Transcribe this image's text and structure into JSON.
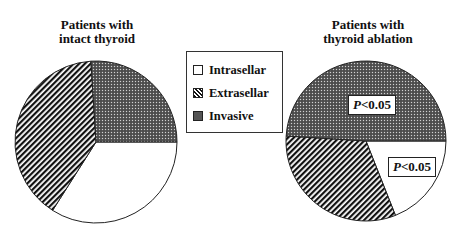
{
  "chart_data": [
    {
      "type": "pie",
      "title": "Patients with intact thyroid",
      "title_lines": [
        "Patients with",
        "intact thyroid"
      ],
      "categories": [
        "Intrasellar",
        "Extrasellar",
        "Invasive"
      ],
      "values": [
        34,
        40,
        26
      ],
      "annotations": []
    },
    {
      "type": "pie",
      "title": "Patients with thyroid ablation",
      "title_lines": [
        "Patients with",
        "thyroid ablation"
      ],
      "categories": [
        "Intrasellar",
        "Extrasellar",
        "Invasive"
      ],
      "values": [
        19,
        32,
        49
      ],
      "annotations": [
        {
          "slice": "Invasive",
          "text": "P<0.05"
        },
        {
          "slice": "Intrasellar",
          "text": "P<0.05"
        }
      ]
    }
  ],
  "legend": {
    "items": [
      {
        "label": "Intrasellar",
        "pattern": "white"
      },
      {
        "label": "Extrasellar",
        "pattern": "diagonal-hatch"
      },
      {
        "label": "Invasive",
        "pattern": "dark-dotted"
      }
    ],
    "position": "center-between-pies"
  },
  "annotations": {
    "right_invasive": {
      "p": "P",
      "rest": "<0.05"
    },
    "right_intrasellar": {
      "p": "P",
      "rest": "<0.05"
    }
  }
}
